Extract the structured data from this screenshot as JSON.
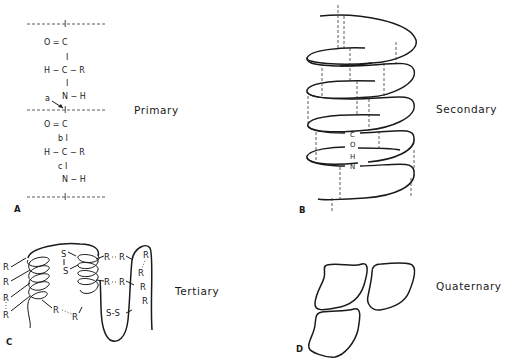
{
  "panels": {
    "A": {
      "letter": "A",
      "title": "Primary",
      "rows": [
        "I",
        "O = C",
        "I",
        "H − C − R",
        "I",
        "N − H",
        "I",
        "O = C",
        "b I",
        "H − C − R",
        "c I",
        "N − H",
        "I"
      ],
      "bond_label_a": "a",
      "residue1": {
        "carbonyl": "O = C",
        "alpha": "H − C − R",
        "amide": "N − H"
      },
      "residue2": {
        "carbonyl": "O = C",
        "alpha": "H − C − R",
        "amide": "N − H"
      },
      "bond_labels": {
        "a": "a",
        "b": "b I",
        "c": "c I"
      },
      "bond_bar": "I"
    },
    "B": {
      "letter": "B",
      "title": "Secondary",
      "hbond_labels": [
        "C",
        "O",
        "H",
        "N"
      ]
    },
    "C": {
      "letter": "C",
      "title": "Tertiary",
      "r": "R",
      "s": "S",
      "ss": "S-S"
    },
    "D": {
      "letter": "D",
      "title": "Quaternary"
    }
  }
}
